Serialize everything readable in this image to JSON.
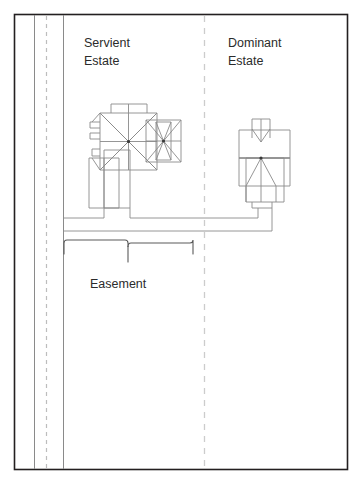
{
  "figure": {
    "type": "property-easement-diagram",
    "background_color": "#ffffff",
    "frame": {
      "stroke": "#231f20",
      "x": 14,
      "y": 14,
      "width": 334,
      "height": 456
    },
    "line_color": "#8a8a8a",
    "dashed_color": "#c9c9c9"
  },
  "labels": {
    "servient_line1": "Servient",
    "servient_line2": "Estate",
    "dominant_line1": "Dominant",
    "dominant_line2": "Estate",
    "easement": "Easement"
  },
  "elements": {
    "road_name": "road-strip",
    "road_centerline_name": "road-dashed-centerline",
    "property_line_name": "property-boundary-dashed-line",
    "servient_house_name": "servient-estate-building",
    "dominant_house_name": "dominant-estate-building",
    "driveway_name": "shared-driveway",
    "bracket_name": "easement-bracket"
  }
}
